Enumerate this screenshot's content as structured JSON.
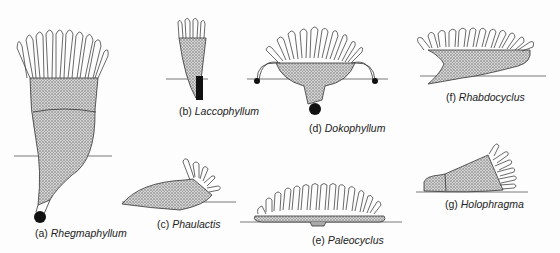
{
  "figure": {
    "background": "#fdfdfd",
    "ink": "#222222",
    "specimens": [
      {
        "id": "a",
        "letter": "(a)",
        "name": "Rhegmaphyllum"
      },
      {
        "id": "b",
        "letter": "(b)",
        "name": "Laccophyllum"
      },
      {
        "id": "c",
        "letter": "(c)",
        "name": "Phaulactis"
      },
      {
        "id": "d",
        "letter": "(d)",
        "name": "Dokophyllum"
      },
      {
        "id": "e",
        "letter": "(e)",
        "name": "Paleocyclus"
      },
      {
        "id": "f",
        "letter": "(f)",
        "name": "Rhabdocyclus"
      },
      {
        "id": "g",
        "letter": "(g)",
        "name": "Holophragma"
      }
    ]
  }
}
